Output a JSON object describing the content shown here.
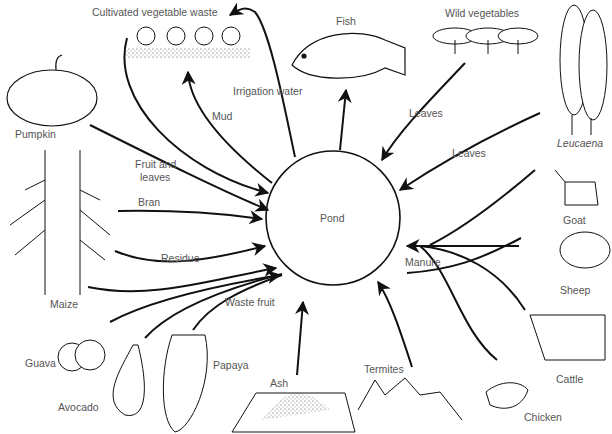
{
  "diagram": {
    "center": {
      "label": "Pond"
    },
    "sources": [
      {
        "id": "pumpkin",
        "label": "Pumpkin"
      },
      {
        "id": "maize",
        "label": "Maize"
      },
      {
        "id": "guava",
        "label": "Guava"
      },
      {
        "id": "avocado",
        "label": "Avocado"
      },
      {
        "id": "papaya",
        "label": "Papaya"
      },
      {
        "id": "ash",
        "label": "Ash"
      },
      {
        "id": "termites",
        "label": "Termites"
      },
      {
        "id": "chicken",
        "label": "Chicken"
      },
      {
        "id": "cattle",
        "label": "Cattle"
      },
      {
        "id": "sheep",
        "label": "Sheep"
      },
      {
        "id": "goat",
        "label": "Goat"
      },
      {
        "id": "leucaena",
        "label": "Leucaena"
      },
      {
        "id": "wild_vegetables",
        "label": "Wild vegetables"
      },
      {
        "id": "cultivated_vegetable_waste",
        "label": "Cultivated vegetable waste"
      }
    ],
    "outputs": [
      {
        "id": "fish",
        "label": "Fish"
      }
    ],
    "flow_labels": {
      "fruit_and_leaves_1": "Fruit and",
      "fruit_and_leaves_2": "leaves",
      "bran": "Bran",
      "residue": "Residue",
      "waste_fruit": "Waste fruit",
      "manure": "Manure",
      "leaves_wild": "Leaves",
      "leaves_leucaena": "Leaves",
      "mud": "Mud",
      "irrigation_water": "Irrigation water"
    },
    "edges": [
      {
        "from": "Cultivated vegetable waste",
        "to": "Pond"
      },
      {
        "from": "Pumpkin",
        "to": "Pond",
        "label": "Fruit and leaves"
      },
      {
        "from": "Maize",
        "to": "Pond",
        "label": "Bran"
      },
      {
        "from": "Maize",
        "to": "Pond",
        "label": "Residue"
      },
      {
        "from": "Guava",
        "to": "Pond",
        "label": "Waste fruit"
      },
      {
        "from": "Avocado",
        "to": "Pond",
        "label": "Waste fruit"
      },
      {
        "from": "Papaya",
        "to": "Pond",
        "label": "Waste fruit"
      },
      {
        "from": "Ash",
        "to": "Pond"
      },
      {
        "from": "Termites",
        "to": "Pond"
      },
      {
        "from": "Goat",
        "to": "Pond",
        "label": "Manure"
      },
      {
        "from": "Sheep",
        "to": "Pond",
        "label": "Manure"
      },
      {
        "from": "Cattle",
        "to": "Pond",
        "label": "Manure"
      },
      {
        "from": "Chicken",
        "to": "Pond",
        "label": "Manure"
      },
      {
        "from": "Leucaena",
        "to": "Pond",
        "label": "Leaves"
      },
      {
        "from": "Wild vegetables",
        "to": "Pond",
        "label": "Leaves"
      },
      {
        "from": "Pond",
        "to": "Fish"
      },
      {
        "from": "Pond",
        "to": "Cultivated vegetable waste",
        "label": "Mud"
      },
      {
        "from": "Pond",
        "to": "Cultivated vegetable waste",
        "label": "Irrigation water"
      }
    ]
  }
}
